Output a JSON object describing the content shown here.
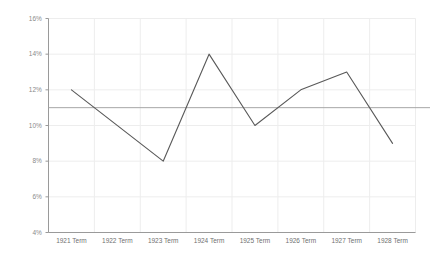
{
  "chart_data": {
    "type": "line",
    "title": "",
    "xlabel": "",
    "ylabel": "",
    "categories": [
      "1921 Term",
      "1922 Term",
      "1923 Term",
      "1924 Term",
      "1925 Term",
      "1926 Term",
      "1927 Term",
      "1928 Term"
    ],
    "values": [
      12,
      null,
      8,
      14,
      10,
      12,
      13,
      9
    ],
    "series": [
      {
        "name": "",
        "values": [
          12,
          null,
          8,
          14,
          10,
          12,
          13,
          9
        ]
      }
    ],
    "ylim": [
      4,
      16
    ],
    "ytick_step": 2,
    "ytick_labels": [
      "16%",
      "14%",
      "12%",
      "10%",
      "8%",
      "6%",
      "4%"
    ],
    "ytick_values": [
      16,
      14,
      12,
      10,
      8,
      6,
      4
    ],
    "reference_line": {
      "value": 11,
      "label": "",
      "color": "#a6a6a6"
    },
    "grid": {
      "horizontal": true,
      "vertical": true,
      "color": "#ededed"
    },
    "legend": {
      "visible": false,
      "position": "none",
      "entries": []
    },
    "colors": {
      "series_line": "#595959",
      "axis": "#9a9a9a",
      "grid": "#ededed",
      "reference": "#a6a6a6",
      "tick_label": "#8a8a8a",
      "background": "#ffffff"
    }
  }
}
